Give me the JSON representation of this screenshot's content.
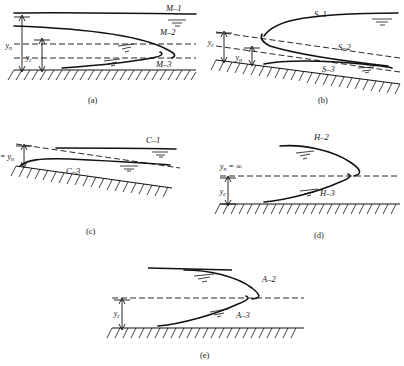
{
  "figure": {
    "type": "gradually-varied-flow-profiles",
    "panels": [
      {
        "id": "a",
        "caption": "(a)",
        "slope_type": "mild",
        "depth_labels": [
          "y_n",
          "y_c"
        ],
        "depth_label_n": "y",
        "depth_sub_n": "n",
        "depth_label_c": "y",
        "depth_sub_c": "c",
        "relation": "y_n > y_c",
        "curves": [
          "M–1",
          "M–2",
          "M–3"
        ]
      },
      {
        "id": "b",
        "caption": "(b)",
        "slope_type": "steep",
        "depth_label_c": "y",
        "depth_sub_c": "c",
        "depth_label_n": "y",
        "depth_sub_n": "n",
        "relation": "y_c > y_n",
        "curves": [
          "S–1",
          "S–2",
          "S–3"
        ]
      },
      {
        "id": "c",
        "caption": "(c)",
        "slope_type": "critical",
        "depth_equation": "y",
        "depth_equation_sub1": "c",
        "depth_equation_mid": " = y",
        "depth_equation_sub2": "n",
        "relation": "y_c = y_n",
        "curves": [
          "C–1",
          "C–3"
        ]
      },
      {
        "id": "d",
        "caption": "(d)",
        "slope_type": "horizontal",
        "depth_inf": "y",
        "depth_inf_sub": "n",
        "depth_inf_rest": " = ∞",
        "depth_label_c": "y",
        "depth_sub_c": "c",
        "relation": "y_n = infinity",
        "curves": [
          "H–2",
          "H–3"
        ]
      },
      {
        "id": "e",
        "caption": "(e)",
        "slope_type": "adverse",
        "depth_label_c": "y",
        "depth_sub_c": "c",
        "relation": "y_n undefined",
        "curves": [
          "A–2",
          "A–3"
        ]
      }
    ],
    "colors": {
      "ink": "#111111",
      "background": "#ffffff"
    }
  },
  "labels": {
    "m1": "M–1",
    "m2": "M–2",
    "m3": "M–3",
    "s1": "S–1",
    "s2": "S–2",
    "s3": "S–3",
    "c1": "C–1",
    "c3": "C–3",
    "h2": "H–2",
    "h3": "H–3",
    "a2": "A–2",
    "a3": "A–3"
  },
  "captions": {
    "a": "(a)",
    "b": "(b)",
    "c": "(c)",
    "d": "(d)",
    "e": "(e)"
  },
  "depths": {
    "y": "y",
    "sub_n": "n",
    "sub_c": "c",
    "eq_cn_main": "y",
    "eq_cn_tail": " = y",
    "inf_tail": " = ∞"
  }
}
